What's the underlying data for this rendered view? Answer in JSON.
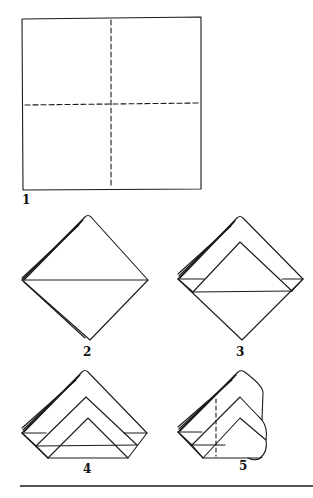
{
  "diagram": {
    "type": "origami-folding-instructions",
    "steps": [
      {
        "number": "1",
        "description": "Square sheet with dashed fold lines (vertical and horizontal)"
      },
      {
        "number": "2",
        "description": "Folded into layered diamond with horizontal crease"
      },
      {
        "number": "3",
        "description": "Top layer folded up forming inner triangle"
      },
      {
        "number": "4",
        "description": "Second layer folded forming nested triangles"
      },
      {
        "number": "5",
        "description": "Sides folded back along dashed vertical line"
      }
    ],
    "colors": {
      "line": "#1a1a1a",
      "rule": "#555555",
      "background": "#ffffff"
    }
  }
}
